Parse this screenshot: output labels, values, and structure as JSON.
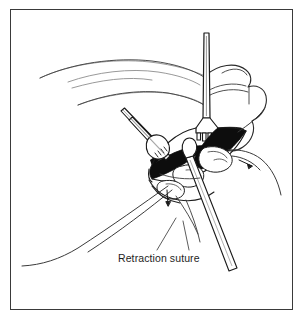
{
  "figure": {
    "domain": "medical-surgical-line-illustration",
    "title": "Retraction suture",
    "background_color": "#ffffff",
    "frame": {
      "border_color": "#3a3a3a",
      "border_width_px": 1.4,
      "x": 10,
      "y": 9,
      "width": 283,
      "height": 301
    },
    "caption": {
      "label": "Retraction suture",
      "x": 118,
      "y": 252,
      "font_size_px": 10.5,
      "color": "#1d1d1d"
    },
    "ink_colors": {
      "outline_dark": "#1a1a1a",
      "outline_mid": "#4a4a4a",
      "outline_light": "#8d8d8d",
      "fill_black": "#0d0d0d",
      "fill_white": "#ffffff"
    },
    "elements": [
      {
        "name": "skin-contour-lines",
        "description": "Light curved anatomical contour lines sweeping across upper left region"
      },
      {
        "name": "retractor-instrument",
        "description": "Vertical rake retractor with four-prong tip entering from top center"
      },
      {
        "name": "forceps-instrument",
        "description": "Serrated tipped forceps entering from upper left toward incision"
      },
      {
        "name": "lower-instrument-shaft",
        "description": "Long instrument shaft descending to lower right"
      },
      {
        "name": "incision-dark-region",
        "description": "Black shaded retracted wound edges at the surgical field center"
      },
      {
        "name": "retraction-suture-left",
        "description": "Long suture strand curving out to the lower left"
      },
      {
        "name": "retraction-suture-right",
        "description": "Suture strand passing off to the right of the wound"
      },
      {
        "name": "arrow-right",
        "description": "Small arrow pointing right beside the wound"
      },
      {
        "name": "arrow-down",
        "description": "Small arrow pointing down below the wound"
      },
      {
        "name": "caption-leader-lines",
        "description": "Two thin leader lines from the caption up to the sutures"
      }
    ]
  }
}
